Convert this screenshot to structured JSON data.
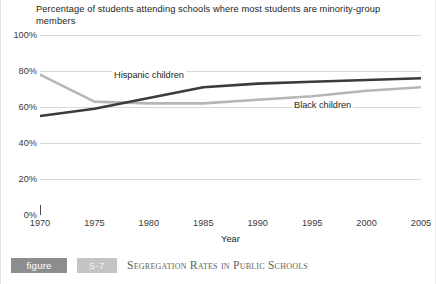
{
  "chart_data": {
    "type": "line",
    "title": "Percentage of students attending schools where most students are minority-group members",
    "xlabel": "Year",
    "ylabel": "",
    "xlim": [
      1970,
      2005
    ],
    "ylim": [
      0,
      100
    ],
    "grid": true,
    "legend_position": "inline-labels",
    "x_ticks": [
      "1970",
      "1975",
      "1980",
      "1985",
      "1990",
      "1995",
      "2000",
      "2005"
    ],
    "y_ticks": [
      "0%",
      "20%",
      "40%",
      "60%",
      "80%",
      "100%"
    ],
    "x": [
      1970,
      1975,
      1980,
      1985,
      1990,
      1995,
      2000,
      2005
    ],
    "series": [
      {
        "name": "Hispanic children",
        "color": "#3b3b3b",
        "values": [
          55,
          59,
          65,
          71,
          73,
          74,
          75,
          76
        ]
      },
      {
        "name": "Black children",
        "color": "#b6b6b6",
        "values": [
          78,
          63,
          62,
          62,
          64,
          66,
          69,
          71
        ]
      }
    ],
    "annotations": [
      {
        "text": "Hispanic children",
        "x": 1980,
        "y": 80
      },
      {
        "text": "Black children",
        "x": 1996,
        "y": 64
      }
    ]
  },
  "caption": {
    "figure_label": "figure",
    "figure_number": "5-7",
    "title": "Segregation Rates in Public Schools"
  },
  "colors": {
    "hispanic_line": "#3b3b3b",
    "black_line": "#b6b6b6",
    "gridline": "#d8d8d8",
    "axis": "#4a4a4a",
    "badge_dark": "#8b8d8f",
    "badge_light": "#c2c4c6"
  }
}
